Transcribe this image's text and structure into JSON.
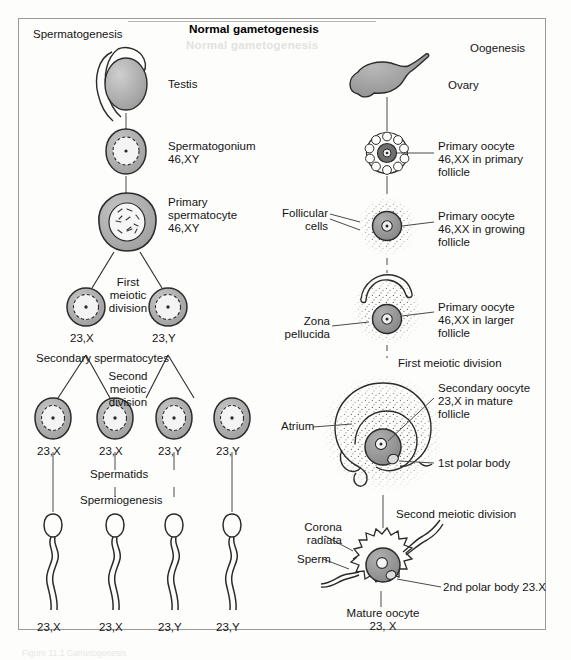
{
  "figure": {
    "title": "Normal gametogenesis",
    "left_heading": "Spermatogenesis",
    "right_heading": "Oogenesis",
    "background": "#fdfdfc",
    "frame_border": "#9a9a9a",
    "ink": "#2b2b2b",
    "cell_fill": "#a8a8a8",
    "nucleus_fill": "#f2f2f2",
    "caption_faint": "Figure 11.1  Gametogenesis"
  },
  "spermatogenesis": {
    "organ_label": "Testis",
    "steps": [
      {
        "label": "Spermatogonium",
        "karyotype": "46,XY"
      },
      {
        "label": "Primary\nspermatocyte",
        "karyotype": "46,XY"
      }
    ],
    "first_division": "First\nmeiotic\ndivision",
    "secondary_label": "Secondary spermatocytes",
    "second_division": "Second\nmeiotic\ndivision",
    "secondary_cells": [
      "23,X",
      "23,Y"
    ],
    "spermatid_label": "Spermatids",
    "spermiogenesis_label": "Spermiogenesis",
    "spermatids": [
      "23,X",
      "23,X",
      "23,Y",
      "23,Y"
    ],
    "sperm": [
      "23,X",
      "23,X",
      "23,Y",
      "23,Y"
    ]
  },
  "oogenesis": {
    "organ_label": "Ovary",
    "steps": [
      {
        "label": "Primary oocyte\n46,XX in primary\nfollicle"
      },
      {
        "label": "Primary oocyte\n46,XX in growing\nfollicle"
      },
      {
        "label": "Primary oocyte\n46,XX in larger\nfollicle"
      },
      {
        "label": "Secondary oocyte\n23,X in mature\nfollicle"
      }
    ],
    "callouts": {
      "follicular_cells": "Follicular\ncells",
      "zona_pellucida": "Zona\npellucida",
      "atrium": "Atrium",
      "first_polar_body": "1st polar body",
      "corona_radiata": "Corona\nradiata",
      "sperm": "Sperm",
      "second_polar_body": "2nd polar body 23.X"
    },
    "first_division": "First meiotic division",
    "second_division": "Second meiotic division",
    "mature_oocyte": "Mature oocyte\n23, X"
  }
}
